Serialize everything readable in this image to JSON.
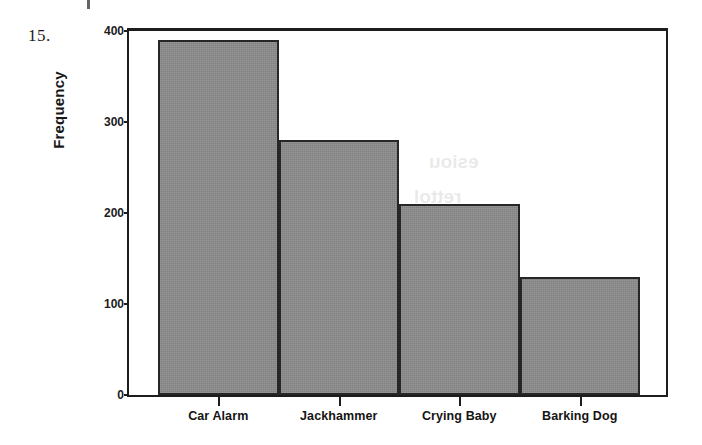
{
  "question_number": "15.",
  "chart_data": {
    "type": "bar",
    "title": "",
    "subtitle": "",
    "xlabel": "",
    "ylabel": "Frequency",
    "categories": [
      "Car Alarm",
      "Jackhammer",
      "Crying Baby",
      "Barking Dog"
    ],
    "values": [
      390,
      280,
      210,
      130
    ],
    "ylim": [
      0,
      400
    ],
    "y_ticks": [
      0,
      100,
      200,
      300,
      400
    ],
    "y_tick_labels": [
      "0",
      "100",
      "200",
      "300",
      "400"
    ],
    "grid": false,
    "legend": false,
    "bar_color": "#8a8a8a",
    "bar_edge_color": "#262626",
    "axis_color": "#1d1d1d",
    "plot_background": "#ffffff",
    "annotations": []
  },
  "ghost_text": {
    "line1": "esiou",
    "line2": "rettol",
    "line3": "yrotsiH"
  }
}
